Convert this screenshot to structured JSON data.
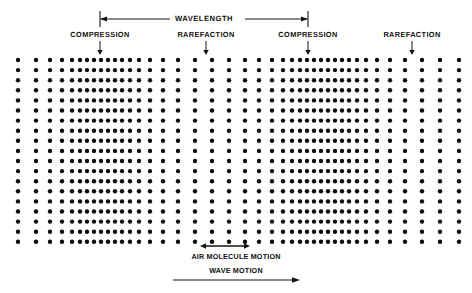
{
  "figure": {
    "title_text": "Longitudinal sound wave diagram showing compressions and rarefactions",
    "background_color": "#ffffff",
    "ink_color": "#0d0d0d"
  },
  "wavelength_bracket": {
    "label": "WAVELENGTH",
    "left_tick_x": 100,
    "right_tick_x": 308,
    "line_y": 19,
    "tick_top_y": 11,
    "tick_bottom_y": 27
  },
  "region_labels": [
    {
      "name": "compression-1",
      "text": "COMPRESSION",
      "x": 100,
      "y": 30,
      "arrow_x": 100,
      "arrow_top": 41,
      "arrow_bottom": 55
    },
    {
      "name": "rarefaction-1",
      "text": "RAREFACTION",
      "x": 206,
      "y": 30,
      "arrow_x": 206,
      "arrow_top": 41,
      "arrow_bottom": 55
    },
    {
      "name": "compression-2",
      "text": "COMPRESSION",
      "x": 308,
      "y": 30,
      "arrow_x": 308,
      "arrow_top": 41,
      "arrow_bottom": 55
    },
    {
      "name": "rarefaction-2",
      "text": "RAREFACTION",
      "x": 412,
      "y": 30,
      "arrow_x": 412,
      "arrow_top": 41,
      "arrow_bottom": 55
    }
  ],
  "bottom_annotations": [
    {
      "name": "air-molecule-motion",
      "text": "AIR MOLECULE MOTION",
      "label_x": 236,
      "label_y": 252,
      "arrow_kind": "double",
      "arrow_y": 246,
      "arrow_x1": 200,
      "arrow_x2": 250
    },
    {
      "name": "wave-motion",
      "text": "WAVE MOTION",
      "label_x": 236,
      "label_y": 266,
      "arrow_kind": "single-right",
      "arrow_y": 280,
      "arrow_x1": 173,
      "arrow_x2": 300
    }
  ],
  "dot_field": {
    "rows": 19,
    "row_top_y": 60,
    "row_spacing": 10.1,
    "dot_radius": 2.2,
    "column_x": [
      18,
      36,
      50,
      62,
      72,
      80,
      87,
      94,
      101,
      108,
      115,
      122,
      130,
      139,
      150,
      163,
      178,
      195,
      212,
      229,
      245,
      259,
      272,
      283,
      292,
      300,
      307,
      314,
      321,
      328,
      335,
      342,
      349,
      357,
      366,
      377,
      390,
      405,
      422,
      440,
      459
    ]
  }
}
